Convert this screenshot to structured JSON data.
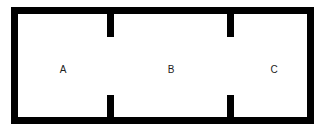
{
  "diagram": {
    "type": "floor-plan",
    "wall_color": "#000000",
    "background_color": "#ffffff",
    "rooms": [
      {
        "id": "A",
        "label": "A"
      },
      {
        "id": "B",
        "label": "B"
      },
      {
        "id": "C",
        "label": "C"
      }
    ],
    "openings": [
      {
        "between": [
          "A",
          "B"
        ]
      },
      {
        "between": [
          "B",
          "C"
        ]
      }
    ]
  }
}
